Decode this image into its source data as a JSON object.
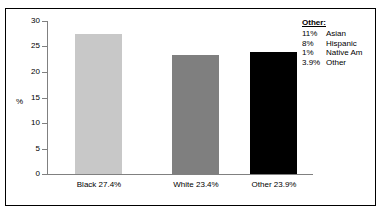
{
  "chart_data": {
    "type": "bar",
    "title": "",
    "xlabel": "",
    "ylabel": "%",
    "ylim": [
      0,
      30
    ],
    "yticks": [
      0,
      5,
      10,
      15,
      20,
      25,
      30
    ],
    "ytick_labels": [
      "0",
      "5",
      "10",
      "15",
      "20",
      "25",
      "30"
    ],
    "grid": false,
    "legend_position": "top-right",
    "categories": [
      "Black",
      "White",
      "Other"
    ],
    "tick_labels": [
      "Black 27.4%",
      "White 23.4%",
      "Other 23.9%"
    ],
    "values": [
      27.4,
      23.4,
      23.9
    ],
    "bar_colors": [
      "#c8c8c8",
      "#7f7f7f",
      "#000000"
    ],
    "annotations": {
      "other_breakdown_title": "Other:",
      "other_breakdown": [
        {
          "percent": "11%",
          "label": "Asian"
        },
        {
          "percent": "8%",
          "label": "Hispanic"
        },
        {
          "percent": "1%",
          "label": "Native Am"
        },
        {
          "percent": "3.9%",
          "label": "Other"
        }
      ]
    }
  },
  "axis": {
    "y_title": "%",
    "y_labels": [
      "30",
      "25",
      "20",
      "15",
      "10",
      "5",
      "0"
    ],
    "x_labels": [
      "Black 27.4%",
      "White 23.4%",
      "Other 23.9%"
    ]
  },
  "legend": {
    "title": "Other:",
    "rows": [
      {
        "percent": "11%",
        "label": "Asian"
      },
      {
        "percent": "8%",
        "label": "Hispanic"
      },
      {
        "percent": "1%",
        "label": "Native Am"
      },
      {
        "percent": "3.9%",
        "label": "Other"
      }
    ]
  },
  "colors": {
    "bar_black_category": "#c8c8c8",
    "bar_white_category": "#7f7f7f",
    "bar_other_category": "#000000",
    "axis": "#808080",
    "frame": "#000000",
    "text": "#000000",
    "background": "#ffffff"
  }
}
